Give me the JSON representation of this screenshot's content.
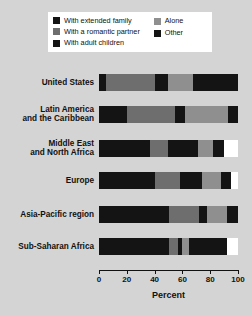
{
  "chart_data": {
    "type": "bar",
    "subtype": "stacked-horizontal-100-percent",
    "title": "",
    "xlabel": "Percent",
    "ylabel": "",
    "xlim": [
      0,
      100
    ],
    "xticks": [
      0,
      20,
      40,
      60,
      80,
      100
    ],
    "xtick_labels": [
      "0",
      "20",
      "40",
      "60",
      "80",
      "100"
    ],
    "grid": false,
    "legend_position": "top",
    "categories": [
      "United States",
      "Latin America and the Caribbean",
      "Middle East and North Africa",
      "Europe",
      "Asia-Pacific region",
      "Sub-Saharan Africa"
    ],
    "category_lines": [
      [
        "United States"
      ],
      [
        "Latin America",
        "and the Caribbean"
      ],
      [
        "Middle East",
        "and North Africa"
      ],
      [
        "Europe"
      ],
      [
        "Asia-Pacific region"
      ],
      [
        "Sub-Saharan Africa"
      ]
    ],
    "series": [
      {
        "name": "With extended family",
        "color": "#141414",
        "values": [
          5,
          20,
          37,
          40,
          50,
          50
        ]
      },
      {
        "name": "With a romantic partner",
        "color": "#6e6e6e",
        "values": [
          35,
          35,
          13,
          18,
          22,
          7
        ]
      },
      {
        "name": "With adult children",
        "color": "#141414",
        "values": [
          10,
          7,
          21,
          16,
          6,
          3
        ]
      },
      {
        "name": "Alone",
        "color": "#8f8f8f",
        "values": [
          18,
          31,
          11,
          14,
          14,
          5
        ]
      },
      {
        "name": "Other",
        "color": "#141414",
        "values": [
          32,
          7,
          8,
          7,
          8,
          27
        ]
      }
    ]
  },
  "legend": {
    "entries_left": [
      {
        "label": "With extended family",
        "color": "#141414"
      },
      {
        "label": "With a romantic partner",
        "color": "#6e6e6e"
      },
      {
        "label": "With adult children",
        "color": "#141414"
      }
    ],
    "entries_right": [
      {
        "label": "Alone",
        "color": "#8f8f8f"
      },
      {
        "label": "Other",
        "color": "#141414"
      }
    ]
  },
  "axis": {
    "title": "Percent",
    "ticks": [
      "0",
      "20",
      "40",
      "60",
      "80",
      "100"
    ]
  },
  "colors": {
    "background": "#d4d4d4",
    "panel": "#ffffff",
    "ink": "#111111",
    "dark": "#141414",
    "mid_gray": "#6e6e6e",
    "light_gray": "#8f8f8f"
  }
}
